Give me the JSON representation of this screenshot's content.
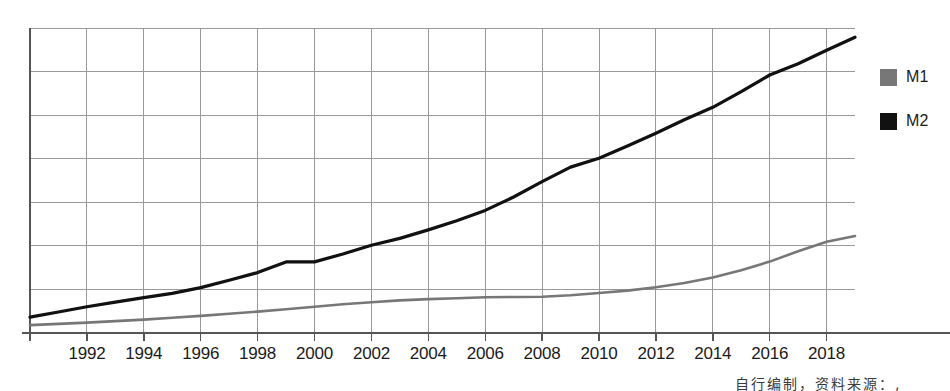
{
  "legend": {
    "position": "right",
    "items": [
      {
        "label": "M1",
        "color": "#777777",
        "swatch_name": "legend-swatch-m1"
      },
      {
        "label": "M2",
        "color": "#111111",
        "swatch_name": "legend-swatch-m2"
      }
    ]
  },
  "footnote": {
    "text": "自行编制，资料来源：,"
  },
  "axis": {
    "x_tick_labels": [
      "1992",
      "1994",
      "1996",
      "1998",
      "2000",
      "2002",
      "2004",
      "2006",
      "2008",
      "2010",
      "2012",
      "2014",
      "2016",
      "2018"
    ],
    "y_tick_labels": [],
    "grid": "both",
    "axis_color": "#555555",
    "grid_color": "#999999"
  },
  "chart_data": {
    "type": "line",
    "title": "",
    "subtitle": "",
    "xlabel": "",
    "ylabel": "",
    "grid": true,
    "legend_position": "right",
    "xlim": [
      1990,
      2019
    ],
    "ylim": [
      0,
      100
    ],
    "x": [
      1990,
      1991,
      1992,
      1993,
      1994,
      1995,
      1996,
      1997,
      1998,
      1999,
      2000,
      2001,
      2002,
      2003,
      2004,
      2005,
      2006,
      2007,
      2008,
      2009,
      2010,
      2011,
      2012,
      2013,
      2014,
      2015,
      2016,
      2017,
      2018,
      2019
    ],
    "series": [
      {
        "name": "M1",
        "color": "#777777",
        "values": [
          2.6,
          3.0,
          3.4,
          3.9,
          4.4,
          5.0,
          5.6,
          6.3,
          7.0,
          7.8,
          8.6,
          9.4,
          10.1,
          10.7,
          11.1,
          11.4,
          11.7,
          11.8,
          11.9,
          12.4,
          13.1,
          13.9,
          15.0,
          16.4,
          18.2,
          20.6,
          23.4,
          26.8,
          29.9,
          31.8
        ]
      },
      {
        "name": "M2",
        "color": "#111111",
        "values": [
          5.2,
          6.9,
          8.6,
          10.1,
          11.6,
          13.0,
          14.9,
          17.3,
          19.8,
          23.3,
          23.3,
          25.9,
          28.8,
          31.0,
          33.8,
          36.8,
          40.2,
          44.6,
          49.6,
          54.4,
          57.3,
          61.3,
          65.5,
          69.9,
          74.0,
          79.1,
          84.6,
          88.3,
          92.7,
          97.0
        ]
      }
    ]
  }
}
